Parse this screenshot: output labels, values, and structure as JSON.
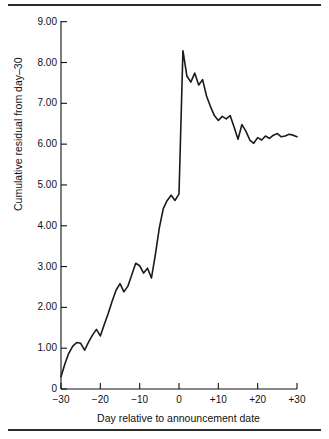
{
  "figure": {
    "top_rule": "horizontal-rule",
    "bottom_rule": "horizontal-rule"
  },
  "chart_data": {
    "type": "line",
    "title": "",
    "xlabel": "Day relative to announcement date",
    "ylabel": "Cumulative residual from day–30",
    "xlim": [
      -30,
      30
    ],
    "ylim": [
      0,
      9
    ],
    "grid": false,
    "legend": null,
    "x_ticks": [
      -30,
      -20,
      -10,
      0,
      10,
      20,
      30
    ],
    "x_tick_labels": [
      "−30",
      "−20",
      "−10",
      "0",
      "+10",
      "+20",
      "+30"
    ],
    "y_ticks": [
      0,
      1,
      2,
      3,
      4,
      5,
      6,
      7,
      8,
      9
    ],
    "y_tick_labels": [
      "0",
      "1.00",
      "2.00",
      "3.00",
      "4.00",
      "5.00",
      "6.00",
      "7.00",
      "8.00",
      "9.00"
    ],
    "series": [
      {
        "name": "Cumulative residual",
        "color": "#1a1a1a",
        "x": [
          -30,
          -29,
          -28,
          -27,
          -26,
          -25,
          -24,
          -23,
          -22,
          -21,
          -20,
          -19,
          -18,
          -17,
          -16,
          -15,
          -14,
          -13,
          -12,
          -11,
          -10,
          -9,
          -8,
          -7,
          -6,
          -5,
          -4,
          -3,
          -2,
          -1,
          0,
          1,
          2,
          3,
          4,
          5,
          6,
          7,
          8,
          9,
          10,
          11,
          12,
          13,
          14,
          15,
          16,
          17,
          18,
          19,
          20,
          21,
          22,
          23,
          24,
          25,
          26,
          27,
          28,
          29,
          30
        ],
        "y": [
          0.3,
          0.62,
          0.88,
          1.05,
          1.14,
          1.12,
          0.95,
          1.15,
          1.32,
          1.46,
          1.3,
          1.58,
          1.85,
          2.15,
          2.42,
          2.58,
          2.38,
          2.52,
          2.8,
          3.08,
          3.02,
          2.84,
          2.96,
          2.72,
          3.3,
          3.95,
          4.42,
          4.62,
          4.75,
          4.62,
          4.78,
          8.29,
          7.67,
          7.52,
          7.74,
          7.45,
          7.58,
          7.18,
          6.92,
          6.7,
          6.58,
          6.68,
          6.62,
          6.7,
          6.42,
          6.12,
          6.48,
          6.32,
          6.1,
          6.02,
          6.16,
          6.1,
          6.2,
          6.14,
          6.22,
          6.26,
          6.18,
          6.2,
          6.24,
          6.22,
          6.18
        ]
      }
    ]
  }
}
